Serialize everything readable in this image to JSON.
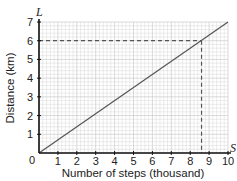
{
  "chart_data": {
    "type": "line",
    "title": "",
    "xlabel": "Number of steps (thousand)",
    "ylabel": "Distance (km)",
    "x_axis_symbol": "S",
    "y_axis_symbol": "L",
    "origin_label": "0",
    "xlim": [
      0,
      10
    ],
    "ylim": [
      0,
      7
    ],
    "x_ticks": [
      "1",
      "2",
      "3",
      "4",
      "5",
      "6",
      "7",
      "8",
      "9",
      "10"
    ],
    "y_ticks": [
      "1",
      "2",
      "3",
      "4",
      "5",
      "6",
      "7"
    ],
    "grid": true,
    "series": [
      {
        "name": "Distance vs steps",
        "x": [
          0,
          10
        ],
        "y": [
          0,
          7
        ]
      }
    ],
    "annotations": [
      {
        "type": "dashed-guide",
        "x": 8.6,
        "y": 6,
        "note": "reading at L = 6 km gives S ≈ 8.6 thousand"
      }
    ],
    "colors": {
      "line": "#555555",
      "grid": "#d0d0d0",
      "axis": "#111111",
      "dash": "#555555"
    }
  }
}
